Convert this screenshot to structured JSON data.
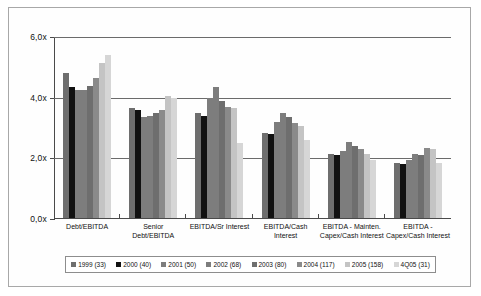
{
  "chart_data": {
    "type": "bar",
    "title": "",
    "xlabel": "",
    "ylabel": "",
    "ylim": [
      0,
      6
    ],
    "ytick_labels": [
      "0,0x",
      "2,0x",
      "4,0x",
      "6,0x"
    ],
    "ytick_values": [
      0,
      2,
      4,
      6
    ],
    "grid": true,
    "legend_position": "bottom",
    "categories": [
      "Debt/EBITDA",
      "Senior Debt/EBITDA",
      "EBITDA/Sr Interest",
      "EBITDA/Cash Interest",
      "EBITDA - Mainten. Capex/Cash Interest",
      "EBITDA - Capex/Cash Interest"
    ],
    "series": [
      {
        "name": "1999 (33)",
        "color": "#6e6e6e",
        "values": [
          4.8,
          3.65,
          3.5,
          2.85,
          2.15,
          1.85
        ]
      },
      {
        "name": "2000 (40)",
        "color": "#111111",
        "values": [
          4.35,
          3.6,
          3.4,
          2.8,
          2.1,
          1.8
        ]
      },
      {
        "name": "2001 (50)",
        "color": "#7d7d7d",
        "values": [
          4.25,
          3.35,
          4.0,
          3.2,
          2.25,
          1.95
        ]
      },
      {
        "name": "2002 (68)",
        "color": "#7d7d7d",
        "values": [
          4.25,
          3.4,
          4.35,
          3.5,
          2.55,
          2.15
        ]
      },
      {
        "name": "2003 (80)",
        "color": "#6e6e6e",
        "values": [
          4.4,
          3.5,
          3.9,
          3.35,
          2.4,
          2.1
        ]
      },
      {
        "name": "2004 (117)",
        "color": "#8a8a8a",
        "values": [
          4.65,
          3.6,
          3.7,
          3.15,
          2.3,
          2.35
        ]
      },
      {
        "name": "2005 (158)",
        "color": "#c4c4c4",
        "values": [
          5.15,
          4.05,
          3.65,
          3.05,
          2.15,
          2.3
        ]
      },
      {
        "name": "4Q05 (31)",
        "color": "#d6d6d6",
        "values": [
          5.4,
          4.0,
          2.5,
          2.6,
          1.95,
          1.85
        ]
      }
    ]
  }
}
